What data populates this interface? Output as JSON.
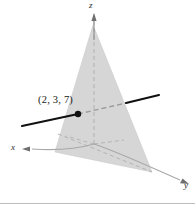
{
  "figure": {
    "width": 195,
    "height": 204,
    "background": "#ffffff"
  },
  "axes": {
    "x_label": "x",
    "y_label": "y",
    "z_label": "z",
    "axis_color": "#9a9a9a",
    "hidden_axis_color": "#b4b4b4",
    "origin": {
      "x": 94,
      "y": 144
    }
  },
  "plane": {
    "name": "shaded-plane",
    "fill": "#d6d6d6",
    "edge_color": "#c9c9c9",
    "vertices": [
      {
        "x": 93,
        "y": 25
      },
      {
        "x": 152,
        "y": 172
      },
      {
        "x": 55,
        "y": 152
      }
    ]
  },
  "line": {
    "name": "normal-line",
    "color": "#111111",
    "hidden_color": "#9b9b9b",
    "visible_left": {
      "x1": 22,
      "y1": 126,
      "x2": 78,
      "y2": 114
    },
    "hidden_middle": {
      "x1": 78,
      "y1": 114,
      "x2": 126,
      "y2": 103
    },
    "visible_right": {
      "x1": 126,
      "y1": 103,
      "x2": 159,
      "y2": 95
    }
  },
  "point": {
    "name": "marked-point",
    "label": "(2, 3, 7)",
    "color": "#111111",
    "x": 78,
    "y": 114,
    "radius": 3.2,
    "label_x": 38,
    "label_y": 95
  },
  "labels": {
    "x": {
      "text": "x",
      "x": 11,
      "y": 145
    },
    "y": {
      "text": "y",
      "x": 184,
      "y": 183
    },
    "z": {
      "text": "z",
      "x": 89,
      "y": 3
    }
  }
}
